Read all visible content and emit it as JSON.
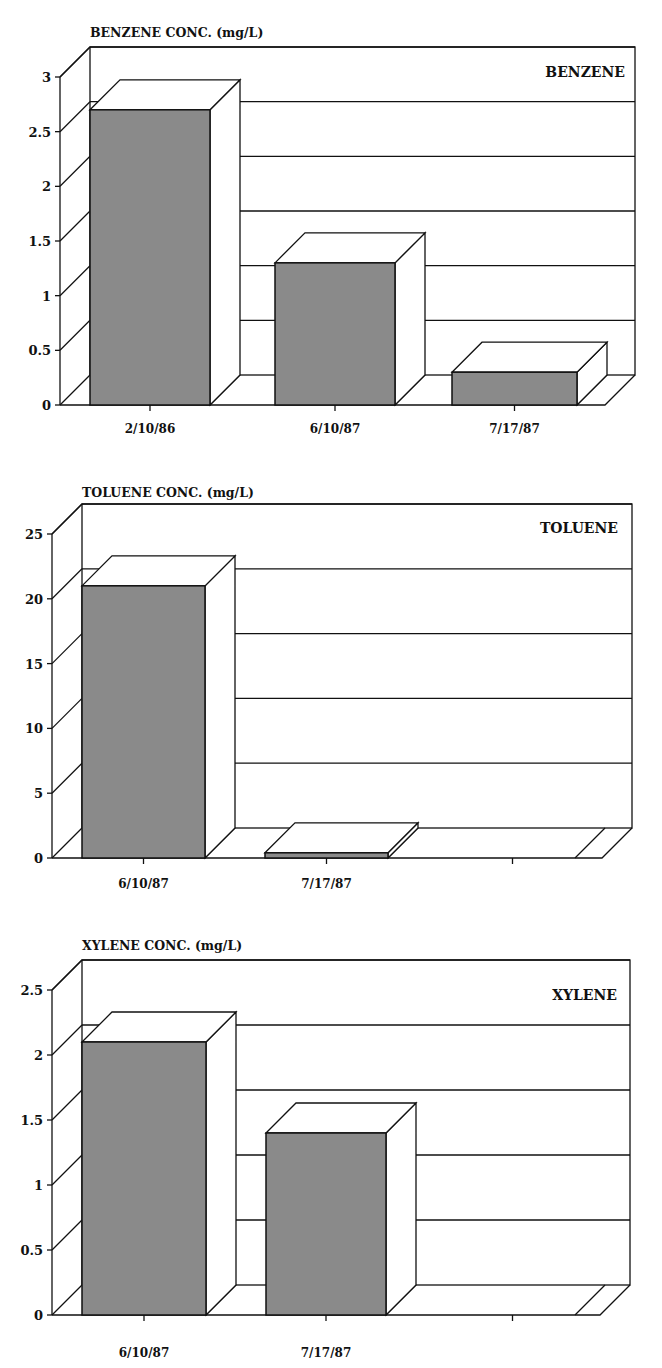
{
  "chart_data": [
    {
      "type": "bar",
      "style": "3d",
      "title": "BENZENE",
      "ylabel": "BENZENE CONC. (mg/L)",
      "xlabel": "",
      "categories": [
        "2/10/86",
        "6/10/87",
        "7/17/87"
      ],
      "values": [
        2.7,
        1.3,
        0.3
      ],
      "ylim": [
        0,
        3
      ],
      "yticks": [
        "0",
        "0.5",
        "1",
        "1.5",
        "2",
        "2.5",
        "3"
      ],
      "grid": true,
      "legend": "none"
    },
    {
      "type": "bar",
      "style": "3d",
      "title": "TOLUENE",
      "ylabel": "TOLUENE CONC. (mg/L)",
      "xlabel": "",
      "categories": [
        "6/10/87",
        "7/17/87",
        ""
      ],
      "values": [
        21,
        0.4,
        0
      ],
      "ylim": [
        0,
        25
      ],
      "yticks": [
        "0",
        "5",
        "10",
        "15",
        "20",
        "25"
      ],
      "grid": true,
      "legend": "none"
    },
    {
      "type": "bar",
      "style": "3d",
      "title": "XYLENE",
      "ylabel": "XYLENE CONC. (mg/L)",
      "xlabel": "",
      "categories": [
        "6/10/87",
        "7/17/87",
        ""
      ],
      "values": [
        2.1,
        1.4,
        0
      ],
      "ylim": [
        0,
        2.5
      ],
      "yticks": [
        "0",
        "0.5",
        "1",
        "1.5",
        "2",
        "2.5"
      ],
      "grid": true,
      "legend": "none"
    }
  ],
  "colors": {
    "bar_front": "#8a8a8a",
    "bar_side": "#ffffff",
    "line": "#111111",
    "background": "#ffffff"
  }
}
